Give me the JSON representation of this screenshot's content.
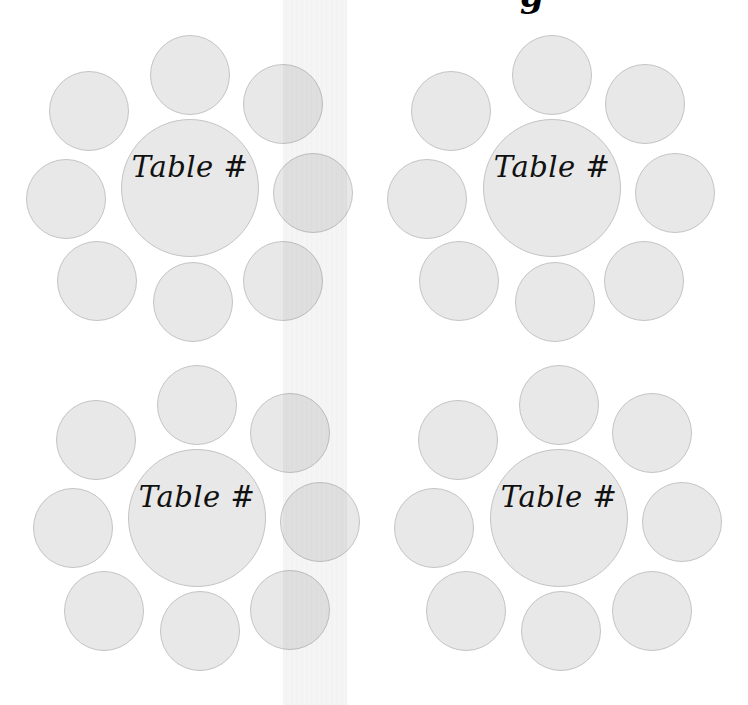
{
  "page": {
    "title_fragment": "g",
    "background_color": "#ffffff",
    "circle_fill": "#e8e8e8",
    "circle_border": "#c4c4c4"
  },
  "tables": [
    {
      "label": "Table #",
      "center": {
        "x": 190,
        "y": 188,
        "r": 69
      },
      "seats": [
        {
          "x": 190,
          "y": 75
        },
        {
          "x": 89,
          "y": 111
        },
        {
          "x": 283,
          "y": 104
        },
        {
          "x": 66,
          "y": 199
        },
        {
          "x": 313,
          "y": 193
        },
        {
          "x": 97,
          "y": 281
        },
        {
          "x": 193,
          "y": 302
        },
        {
          "x": 283,
          "y": 281
        }
      ]
    },
    {
      "label": "Table #",
      "center": {
        "x": 552,
        "y": 188,
        "r": 69
      },
      "seats": [
        {
          "x": 552,
          "y": 75
        },
        {
          "x": 451,
          "y": 111
        },
        {
          "x": 645,
          "y": 104
        },
        {
          "x": 427,
          "y": 199
        },
        {
          "x": 675,
          "y": 193
        },
        {
          "x": 459,
          "y": 281
        },
        {
          "x": 555,
          "y": 302
        },
        {
          "x": 644,
          "y": 281
        }
      ]
    },
    {
      "label": "Table #",
      "center": {
        "x": 197,
        "y": 518,
        "r": 69
      },
      "seats": [
        {
          "x": 197,
          "y": 405
        },
        {
          "x": 96,
          "y": 440
        },
        {
          "x": 290,
          "y": 433
        },
        {
          "x": 73,
          "y": 528
        },
        {
          "x": 320,
          "y": 522
        },
        {
          "x": 104,
          "y": 611
        },
        {
          "x": 200,
          "y": 631
        },
        {
          "x": 290,
          "y": 610
        }
      ]
    },
    {
      "label": "Table #",
      "center": {
        "x": 559,
        "y": 518,
        "r": 69
      },
      "seats": [
        {
          "x": 559,
          "y": 405
        },
        {
          "x": 458,
          "y": 440
        },
        {
          "x": 652,
          "y": 433
        },
        {
          "x": 434,
          "y": 528
        },
        {
          "x": 682,
          "y": 522
        },
        {
          "x": 466,
          "y": 611
        },
        {
          "x": 561,
          "y": 631
        },
        {
          "x": 652,
          "y": 611
        }
      ]
    }
  ],
  "seat_radius": 40
}
